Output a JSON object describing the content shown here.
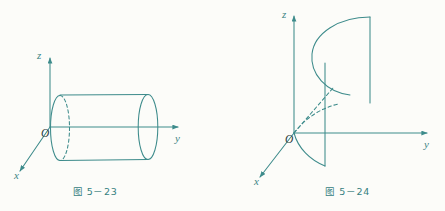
{
  "page": {
    "background_color": "#fcfcf9",
    "ink_color": "#3d8b8b",
    "label_color": "#3c8585"
  },
  "figures": [
    {
      "id": "figure-5-23",
      "caption": "图 5－23",
      "subject": "circular cylinder along the y-axis",
      "axes": {
        "z_label": "z",
        "y_label": "y",
        "x_label": "x",
        "origin_label": "O"
      }
    },
    {
      "id": "figure-5-24",
      "caption": "图 5－24",
      "subject": "parabolic cylinder opening toward negative y",
      "axes": {
        "z_label": "z",
        "y_label": "y",
        "x_label": "x",
        "origin_label": "O"
      }
    }
  ]
}
